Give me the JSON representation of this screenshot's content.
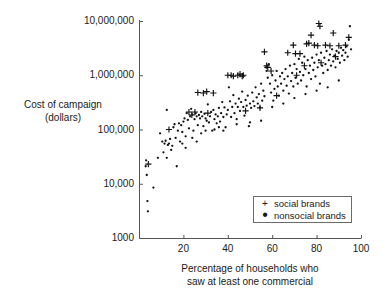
{
  "chart_data": {
    "type": "scatter",
    "title": "",
    "xlabel": "Percentage of households who\nsaw at least one commercial",
    "ylabel": "Cost of campaign\n(dollars)",
    "xlim": [
      0,
      100
    ],
    "ylim": [
      1000,
      10000000
    ],
    "yscale": "log",
    "xscale": "linear",
    "grid": false,
    "xticks": [
      20,
      40,
      60,
      80,
      100
    ],
    "xtick_labels": [
      "20",
      "40",
      "60",
      "80",
      "100"
    ],
    "yticks": [
      1000,
      10000,
      100000,
      1000000,
      10000000
    ],
    "ytick_labels": [
      "1000",
      "10,000",
      "100,000",
      "1,000,000",
      "10,000,000"
    ],
    "legend_position": "lower right",
    "legend_entries": [
      {
        "label": "social brands",
        "marker": "+"
      },
      {
        "label": "nonsocial brands",
        "marker": "."
      }
    ],
    "series": [
      {
        "name": "social brands",
        "marker": "plus",
        "color": "#111111",
        "points": [
          [
            4.2,
            23000
          ],
          [
            13.5,
            100000
          ],
          [
            22.5,
            210000
          ],
          [
            23.8,
            185000
          ],
          [
            25.2,
            210000
          ],
          [
            26.5,
            480000
          ],
          [
            29.0,
            470000
          ],
          [
            30.5,
            500000
          ],
          [
            31.0,
            200000
          ],
          [
            33.5,
            470000
          ],
          [
            40.0,
            1000000
          ],
          [
            41.5,
            1000000
          ],
          [
            42.5,
            960000
          ],
          [
            44.5,
            1000000
          ],
          [
            45.5,
            1050000
          ],
          [
            46.5,
            960000
          ],
          [
            47.0,
            1000000
          ],
          [
            48.0,
            220000
          ],
          [
            54.5,
            250000
          ],
          [
            56.5,
            2700000
          ],
          [
            57.5,
            1500000
          ],
          [
            58.0,
            1400000
          ],
          [
            59.5,
            1200000
          ],
          [
            62.0,
            420000
          ],
          [
            67.0,
            2600000
          ],
          [
            69.5,
            3600000
          ],
          [
            70.5,
            2500000
          ],
          [
            71.0,
            1000000
          ],
          [
            72.5,
            2500000
          ],
          [
            74.5,
            1500000
          ],
          [
            75.5,
            3800000
          ],
          [
            76.5,
            3900000
          ],
          [
            77.5,
            5500000
          ],
          [
            79.0,
            3600000
          ],
          [
            80.5,
            3500000
          ],
          [
            81.0,
            9000000
          ],
          [
            81.5,
            8000000
          ],
          [
            82.0,
            1700000
          ],
          [
            84.0,
            3600000
          ],
          [
            86.0,
            3500000
          ],
          [
            87.5,
            6000000
          ],
          [
            88.5,
            2200000
          ],
          [
            90.0,
            3500000
          ],
          [
            93.0,
            3600000
          ],
          [
            94.5,
            5000000
          ]
        ]
      },
      {
        "name": "nonsocial brands",
        "marker": "dot",
        "color": "#111111",
        "points": [
          [
            3.0,
            21000
          ],
          [
            3.2,
            27000
          ],
          [
            3.5,
            14500
          ],
          [
            3.8,
            4800
          ],
          [
            4.0,
            3100
          ],
          [
            6.5,
            8500
          ],
          [
            8.5,
            30000
          ],
          [
            9.5,
            85000
          ],
          [
            10.5,
            60000
          ],
          [
            11.0,
            38000
          ],
          [
            11.5,
            55000
          ],
          [
            12.0,
            62000
          ],
          [
            12.5,
            30000
          ],
          [
            13.0,
            52000
          ],
          [
            13.5,
            55000
          ],
          [
            14.0,
            67000
          ],
          [
            14.5,
            42000
          ],
          [
            15.0,
            50000
          ],
          [
            15.5,
            110000
          ],
          [
            16.0,
            125000
          ],
          [
            16.5,
            70000
          ],
          [
            17.0,
            21000
          ],
          [
            17.5,
            95000
          ],
          [
            18.0,
            130000
          ],
          [
            18.5,
            60000
          ],
          [
            19.0,
            120000
          ],
          [
            19.5,
            90000
          ],
          [
            20.0,
            140000
          ],
          [
            20.5,
            160000
          ],
          [
            21.0,
            75000
          ],
          [
            21.5,
            200000
          ],
          [
            22.0,
            150000
          ],
          [
            22.5,
            105000
          ],
          [
            23.0,
            175000
          ],
          [
            23.5,
            240000
          ],
          [
            24.0,
            190000
          ],
          [
            24.5,
            95000
          ],
          [
            25.0,
            155000
          ],
          [
            25.5,
            200000
          ],
          [
            26.0,
            175000
          ],
          [
            26.5,
            120000
          ],
          [
            27.0,
            185000
          ],
          [
            27.5,
            160000
          ],
          [
            28.0,
            210000
          ],
          [
            28.5,
            175000
          ],
          [
            29.0,
            115000
          ],
          [
            29.5,
            195000
          ],
          [
            30.0,
            160000
          ],
          [
            30.5,
            145000
          ],
          [
            31.0,
            290000
          ],
          [
            31.5,
            135000
          ],
          [
            32.0,
            175000
          ],
          [
            32.5,
            210000
          ],
          [
            33.0,
            95000
          ],
          [
            33.5,
            230000
          ],
          [
            34.0,
            155000
          ],
          [
            34.5,
            190000
          ],
          [
            35.0,
            130000
          ],
          [
            35.5,
            175000
          ],
          [
            36.0,
            250000
          ],
          [
            36.5,
            140000
          ],
          [
            37.0,
            200000
          ],
          [
            37.5,
            320000
          ],
          [
            38.0,
            170000
          ],
          [
            38.5,
            255000
          ],
          [
            39.0,
            110000
          ],
          [
            39.5,
            190000
          ],
          [
            40.0,
            230000
          ],
          [
            40.5,
            600000
          ],
          [
            41.0,
            330000
          ],
          [
            41.5,
            170000
          ],
          [
            42.0,
            260000
          ],
          [
            42.5,
            430000
          ],
          [
            43.0,
            200000
          ],
          [
            43.5,
            300000
          ],
          [
            44.0,
            155000
          ],
          [
            44.5,
            260000
          ],
          [
            45.0,
            370000
          ],
          [
            45.5,
            220000
          ],
          [
            46.0,
            320000
          ],
          [
            46.5,
            500000
          ],
          [
            47.0,
            260000
          ],
          [
            47.5,
            180000
          ],
          [
            48.0,
            350000
          ],
          [
            48.5,
            275000
          ],
          [
            49.0,
            420000
          ],
          [
            49.5,
            115000
          ],
          [
            50.0,
            300000
          ],
          [
            50.5,
            250000
          ],
          [
            51.0,
            480000
          ],
          [
            51.5,
            330000
          ],
          [
            52.0,
            270000
          ],
          [
            52.5,
            600000
          ],
          [
            53.0,
            390000
          ],
          [
            53.5,
            300000
          ],
          [
            54.0,
            450000
          ],
          [
            54.5,
            255000
          ],
          [
            55.0,
            700000
          ],
          [
            55.5,
            340000
          ],
          [
            56.0,
            520000
          ],
          [
            56.5,
            410000
          ],
          [
            57.0,
            1400000
          ],
          [
            57.5,
            1200000
          ],
          [
            58.0,
            900000
          ],
          [
            58.5,
            1600000
          ],
          [
            59.0,
            700000
          ],
          [
            59.5,
            480000
          ],
          [
            60.0,
            1000000
          ],
          [
            60.5,
            340000
          ],
          [
            61.0,
            560000
          ],
          [
            61.5,
            800000
          ],
          [
            62.0,
            1200000
          ],
          [
            62.5,
            620000
          ],
          [
            63.0,
            420000
          ],
          [
            63.5,
            950000
          ],
          [
            64.0,
            700000
          ],
          [
            64.5,
            1100000
          ],
          [
            65.0,
            520000
          ],
          [
            65.5,
            850000
          ],
          [
            66.0,
            1300000
          ],
          [
            66.5,
            640000
          ],
          [
            67.0,
            950000
          ],
          [
            67.5,
            460000
          ],
          [
            68.0,
            1500000
          ],
          [
            68.5,
            780000
          ],
          [
            69.0,
            1100000
          ],
          [
            69.5,
            620000
          ],
          [
            70.0,
            1600000
          ],
          [
            70.5,
            900000
          ],
          [
            71.0,
            1300000
          ],
          [
            71.5,
            700000
          ],
          [
            72.0,
            2000000
          ],
          [
            72.5,
            1150000
          ],
          [
            73.0,
            800000
          ],
          [
            73.5,
            1700000
          ],
          [
            74.0,
            1000000
          ],
          [
            74.5,
            2200000
          ],
          [
            75.0,
            1300000
          ],
          [
            75.5,
            620000
          ],
          [
            76.0,
            1900000
          ],
          [
            76.5,
            1100000
          ],
          [
            77.0,
            1500000
          ],
          [
            77.5,
            850000
          ],
          [
            78.0,
            2100000
          ],
          [
            78.5,
            1250000
          ],
          [
            79.0,
            1700000
          ],
          [
            79.5,
            950000
          ],
          [
            80.0,
            2400000
          ],
          [
            80.5,
            1400000
          ],
          [
            81.0,
            1900000
          ],
          [
            81.5,
            700000
          ],
          [
            82.0,
            2600000
          ],
          [
            82.5,
            1500000
          ],
          [
            83.0,
            1100000
          ],
          [
            83.5,
            2100000
          ],
          [
            84.0,
            1600000
          ],
          [
            84.5,
            2800000
          ],
          [
            85.0,
            1250000
          ],
          [
            85.5,
            1900000
          ],
          [
            86.0,
            2400000
          ],
          [
            86.5,
            1500000
          ],
          [
            87.0,
            3000000
          ],
          [
            87.5,
            1800000
          ],
          [
            88.0,
            2300000
          ],
          [
            88.5,
            1400000
          ],
          [
            89.0,
            2800000
          ],
          [
            89.5,
            2000000
          ],
          [
            90.0,
            2600000
          ],
          [
            90.5,
            1700000
          ],
          [
            91.0,
            3200000
          ],
          [
            91.5,
            2300000
          ],
          [
            92.0,
            2900000
          ],
          [
            92.5,
            1900000
          ],
          [
            93.0,
            2600000
          ],
          [
            93.5,
            3400000
          ],
          [
            94.0,
            2200000
          ],
          [
            94.5,
            4500000
          ],
          [
            95.0,
            8000000
          ],
          [
            95.5,
            3000000
          ],
          [
            12.5,
            230000
          ],
          [
            19.5,
            55000
          ],
          [
            21.0,
            46000
          ],
          [
            24.0,
            70000
          ],
          [
            26.0,
            60000
          ],
          [
            28.0,
            85000
          ],
          [
            30.0,
            95000
          ],
          [
            34.0,
            100000
          ],
          [
            36.0,
            110000
          ],
          [
            38.0,
            95000
          ],
          [
            44.0,
            125000
          ],
          [
            50.0,
            135000
          ],
          [
            55.0,
            145000
          ],
          [
            60.0,
            260000
          ],
          [
            65.0,
            300000
          ],
          [
            70.0,
            380000
          ],
          [
            75.0,
            450000
          ],
          [
            80.0,
            520000
          ],
          [
            85.0,
            600000
          ],
          [
            90.0,
            800000
          ]
        ]
      }
    ]
  },
  "axes": {
    "plot_left_px": 139,
    "plot_right_px": 361,
    "plot_top_px": 21,
    "plot_bottom_px": 238
  }
}
